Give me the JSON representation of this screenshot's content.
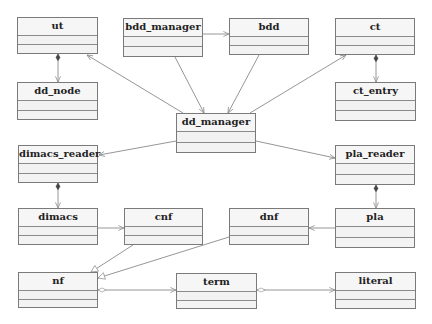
{
  "diagram": {
    "type": "uml-class-diagram",
    "colors": {
      "box_border": "#7a7a7a",
      "box_fill": "#f4f4f4",
      "edge": "#8a8a8a",
      "text": "#222222"
    },
    "classes": [
      {
        "id": "ut",
        "label": "ut",
        "x": 17,
        "y": 17,
        "w": 81,
        "h": 37
      },
      {
        "id": "bdd_manager",
        "label": "bdd_manager",
        "x": 123,
        "y": 18,
        "w": 80,
        "h": 39
      },
      {
        "id": "bdd",
        "label": "bdd",
        "x": 229,
        "y": 18,
        "w": 80,
        "h": 37
      },
      {
        "id": "ct",
        "label": "ct",
        "x": 335,
        "y": 18,
        "w": 80,
        "h": 37
      },
      {
        "id": "dd_node",
        "label": "dd_node",
        "x": 17,
        "y": 82,
        "w": 81,
        "h": 38
      },
      {
        "id": "ct_entry",
        "label": "ct_entry",
        "x": 335,
        "y": 82,
        "w": 81,
        "h": 39
      },
      {
        "id": "dd_manager",
        "label": "dd_manager",
        "x": 176,
        "y": 113,
        "w": 80,
        "h": 40
      },
      {
        "id": "dimacs_reader",
        "label": "dimacs_reader",
        "x": 18,
        "y": 145,
        "w": 80,
        "h": 38
      },
      {
        "id": "pla_reader",
        "label": "pla_reader",
        "x": 335,
        "y": 145,
        "w": 80,
        "h": 40
      },
      {
        "id": "dimacs",
        "label": "dimacs",
        "x": 18,
        "y": 208,
        "w": 80,
        "h": 37
      },
      {
        "id": "cnf",
        "label": "cnf",
        "x": 124,
        "y": 208,
        "w": 79,
        "h": 37
      },
      {
        "id": "dnf",
        "label": "dnf",
        "x": 229,
        "y": 208,
        "w": 80,
        "h": 37
      },
      {
        "id": "pla",
        "label": "pla",
        "x": 335,
        "y": 208,
        "w": 80,
        "h": 40
      },
      {
        "id": "nf",
        "label": "nf",
        "x": 18,
        "y": 272,
        "w": 80,
        "h": 36
      },
      {
        "id": "term",
        "label": "term",
        "x": 176,
        "y": 273,
        "w": 81,
        "h": 36
      },
      {
        "id": "literal",
        "label": "literal",
        "x": 335,
        "y": 272,
        "w": 81,
        "h": 37
      }
    ],
    "relationships": [
      {
        "from": "bdd_manager",
        "to": "bdd",
        "kind": "association",
        "end": "open-arrow"
      },
      {
        "from": "bdd_manager",
        "to": "dd_manager",
        "kind": "association",
        "end": "open-arrow"
      },
      {
        "from": "bdd",
        "to": "dd_manager",
        "kind": "association",
        "end": "open-arrow"
      },
      {
        "from": "dd_manager",
        "to": "ut",
        "kind": "association",
        "end": "open-arrow"
      },
      {
        "from": "dd_manager",
        "to": "ct",
        "kind": "association",
        "end": "open-arrow"
      },
      {
        "from": "dd_manager",
        "to": "dimacs_reader",
        "kind": "association",
        "end": "open-arrow"
      },
      {
        "from": "dd_manager",
        "to": "pla_reader",
        "kind": "association",
        "end": "open-arrow"
      },
      {
        "from": "ut",
        "to": "dd_node",
        "kind": "composition",
        "end": "open-arrow"
      },
      {
        "from": "ct",
        "to": "ct_entry",
        "kind": "composition",
        "end": "open-arrow"
      },
      {
        "from": "dimacs_reader",
        "to": "dimacs",
        "kind": "composition",
        "end": "open-arrow"
      },
      {
        "from": "pla_reader",
        "to": "pla",
        "kind": "composition",
        "end": "open-arrow"
      },
      {
        "from": "dimacs",
        "to": "cnf",
        "kind": "association",
        "end": "open-arrow"
      },
      {
        "from": "pla",
        "to": "dnf",
        "kind": "association",
        "end": "open-arrow"
      },
      {
        "from": "cnf",
        "to": "nf",
        "kind": "generalization",
        "end": "hollow-triangle"
      },
      {
        "from": "dnf",
        "to": "nf",
        "kind": "generalization",
        "end": "hollow-triangle"
      },
      {
        "from": "nf",
        "to": "term",
        "kind": "aggregation",
        "end": "open-arrow"
      },
      {
        "from": "term",
        "to": "literal",
        "kind": "aggregation",
        "end": "open-arrow"
      }
    ]
  }
}
